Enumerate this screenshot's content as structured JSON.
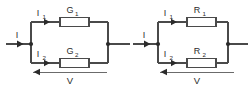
{
  "diagram": {
    "background_color": "#ffffff",
    "wire_color": "#4a4a4a",
    "label_color": "#2b2b2b",
    "circuits": [
      {
        "id": "conductance-circuit",
        "name": "Parallel conductance circuit",
        "source_current_label": "I",
        "voltage_label": "V",
        "branches": [
          {
            "current_label": "I",
            "current_subscript": "1",
            "component_label": "G",
            "component_subscript": "1",
            "component_type": "conductance"
          },
          {
            "current_label": "I",
            "current_subscript": "2",
            "component_label": "G",
            "component_subscript": "2",
            "component_type": "conductance"
          }
        ]
      },
      {
        "id": "resistance-circuit",
        "name": "Parallel resistance circuit",
        "source_current_label": "I",
        "voltage_label": "V",
        "branches": [
          {
            "current_label": "I",
            "current_subscript": "1",
            "component_label": "R",
            "component_subscript": "1",
            "component_type": "resistor"
          },
          {
            "current_label": "I",
            "current_subscript": "2",
            "component_label": "R",
            "component_subscript": "2",
            "component_type": "resistor"
          }
        ]
      }
    ]
  }
}
